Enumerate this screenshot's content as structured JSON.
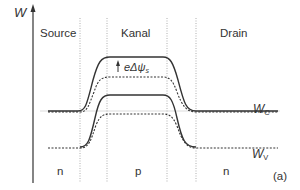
{
  "axis": {
    "label": "W"
  },
  "regions": [
    {
      "name": "Source",
      "doping": "n"
    },
    {
      "name": "Kanal",
      "doping": "p"
    },
    {
      "name": "Drain",
      "doping": "n"
    }
  ],
  "annotation": {
    "delta_label": "eΔψ",
    "delta_sub": "s"
  },
  "bands": {
    "conduction": {
      "label": "W",
      "sub": "C"
    },
    "valence": {
      "label": "W",
      "sub": "V"
    }
  },
  "legend_hint": {
    "solid": "solid line",
    "dashed": "dashed line"
  },
  "figure_tag": "(a)",
  "colors": {
    "line": "#333333",
    "divider": "#9a9a9a",
    "ref": "#c8c8c8"
  }
}
